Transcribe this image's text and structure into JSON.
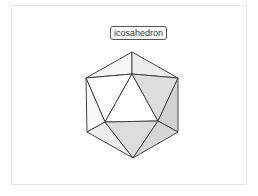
{
  "diagram": {
    "title": "icosahedron",
    "vertices": {
      "top": [
        132,
        52
      ],
      "upper_left": [
        86,
        78
      ],
      "upper_right": [
        178,
        78
      ],
      "inner_top": [
        132,
        74
      ],
      "inner_left": [
        105,
        122
      ],
      "inner_right": [
        158,
        121
      ],
      "lower_left": [
        87,
        132
      ],
      "lower_right": [
        178,
        132
      ],
      "bottom": [
        133,
        158
      ]
    },
    "colors": {
      "edge": "#444444",
      "face_light": "#f4f4f4",
      "face_white": "#ffffff",
      "face_mid": "#e2e2e2",
      "face_dark": "#d4d4d4",
      "frame": "#e6e6e6"
    }
  }
}
